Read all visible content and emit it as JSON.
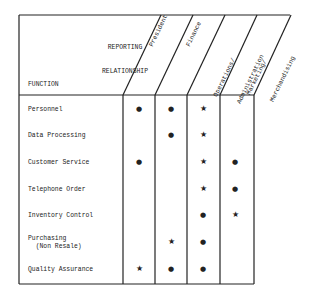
{
  "header": {
    "reporting_line1": "REPORTING",
    "reporting_line2": "RELATIONSHIP",
    "function_label": "FUNCTION"
  },
  "columns": [
    {
      "label_line1": "President",
      "label_line2": ""
    },
    {
      "label_line1": "Finance",
      "label_line2": ""
    },
    {
      "label_line1": "Operations/",
      "label_line2": "Administration"
    },
    {
      "label_line1": "Marketing/",
      "label_line2": "Merchandising"
    }
  ],
  "rows": [
    {
      "label": "Personnel",
      "marks": [
        "dot",
        "dot",
        "star",
        ""
      ]
    },
    {
      "label": "Data Processing",
      "marks": [
        "",
        "dot",
        "star",
        ""
      ]
    },
    {
      "label": "Customer Service",
      "marks": [
        "dot",
        "",
        "star",
        "dot"
      ]
    },
    {
      "label": "Telephone Order",
      "marks": [
        "",
        "",
        "star",
        "dot"
      ]
    },
    {
      "label": "Inventory Control",
      "marks": [
        "",
        "",
        "dot",
        "star"
      ]
    },
    {
      "label": "Purchasing\n  (Non Resale)",
      "marks": [
        "",
        "star",
        "dot",
        ""
      ]
    },
    {
      "label": "Quality Assurance",
      "marks": [
        "star",
        "dot",
        "dot",
        ""
      ]
    }
  ],
  "legend_symbols": {
    "dot": "●",
    "star": "★"
  }
}
